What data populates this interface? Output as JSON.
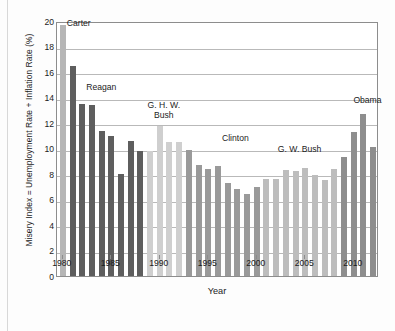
{
  "chart_data": {
    "type": "bar",
    "title": "",
    "xlabel": "Year",
    "ylabel": "Misery Index = Unemployment Rate + Inflation Rate (%)",
    "ylim": [
      0,
      20
    ],
    "ytick_step": 2,
    "yticks": [
      "20",
      "18",
      "16",
      "14",
      "12",
      "10",
      "8",
      "6",
      "4",
      "2",
      "0"
    ],
    "xlim": [
      1979.4,
      2012.6
    ],
    "xticks": [
      "1980",
      "1985",
      "1990",
      "1995",
      "2000",
      "2005",
      "2010"
    ],
    "grid": "horizontal",
    "legend": "none",
    "categories": [
      "1980",
      "1981",
      "1982",
      "1983",
      "1984",
      "1985",
      "1986",
      "1987",
      "1988",
      "1989",
      "1990",
      "1991",
      "1992",
      "1993",
      "1994",
      "1995",
      "1996",
      "1997",
      "1998",
      "1999",
      "2000",
      "2001",
      "2002",
      "2003",
      "2004",
      "2005",
      "2006",
      "2007",
      "2008",
      "2009",
      "2010",
      "2011",
      "2012"
    ],
    "values": [
      19.7,
      16.5,
      13.5,
      13.4,
      11.4,
      11.0,
      8.0,
      10.6,
      9.8,
      9.8,
      11.8,
      10.5,
      10.5,
      9.9,
      8.7,
      8.4,
      8.6,
      7.3,
      6.8,
      6.4,
      7.0,
      7.6,
      7.6,
      8.3,
      8.2,
      8.5,
      7.9,
      7.5,
      8.4,
      9.3,
      11.3,
      12.7,
      10.1
    ],
    "series_groups": [
      {
        "name": "Carter",
        "start": "1980",
        "end": "1980",
        "color": "#b6b6b6"
      },
      {
        "name": "Reagan",
        "start": "1981",
        "end": "1988",
        "color": "#5e5e5e"
      },
      {
        "name": "G. H. W. Bush",
        "start": "1989",
        "end": "1992",
        "color": "#cfcfcf"
      },
      {
        "name": "Clinton",
        "start": "1993",
        "end": "2000",
        "color": "#9a9a9a"
      },
      {
        "name": "G. W. Bush",
        "start": "2001",
        "end": "2008",
        "color": "#bdbdbd"
      },
      {
        "name": "Obama",
        "start": "2009",
        "end": "2012",
        "color": "#8e8e8e"
      }
    ],
    "annotations": [
      {
        "text": "Carter",
        "year": "1980",
        "value": 19.6
      },
      {
        "text": "Reagan",
        "year": "1982",
        "value": 14.6
      },
      {
        "text": "G. H. W.\nBush",
        "year": "1990",
        "value": 13.2
      },
      {
        "text": "Clinton",
        "year": "1996",
        "value": 10.6
      },
      {
        "text": "G. W. Bush",
        "year": "2004",
        "value": 9.7
      },
      {
        "text": "Obama",
        "year": "2011",
        "value": 13.6
      }
    ]
  }
}
